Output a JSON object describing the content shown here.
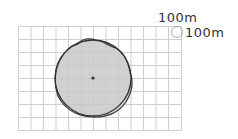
{
  "diagram": {
    "scale_labels": {
      "horizontal": "100m",
      "vertical": "100m"
    },
    "grid": {
      "columns": 13,
      "rows": 8,
      "line_color": "#c8c8c8"
    },
    "area_fill": "#cccccc",
    "outline_color": "#333333",
    "center_point": "center-dot"
  }
}
